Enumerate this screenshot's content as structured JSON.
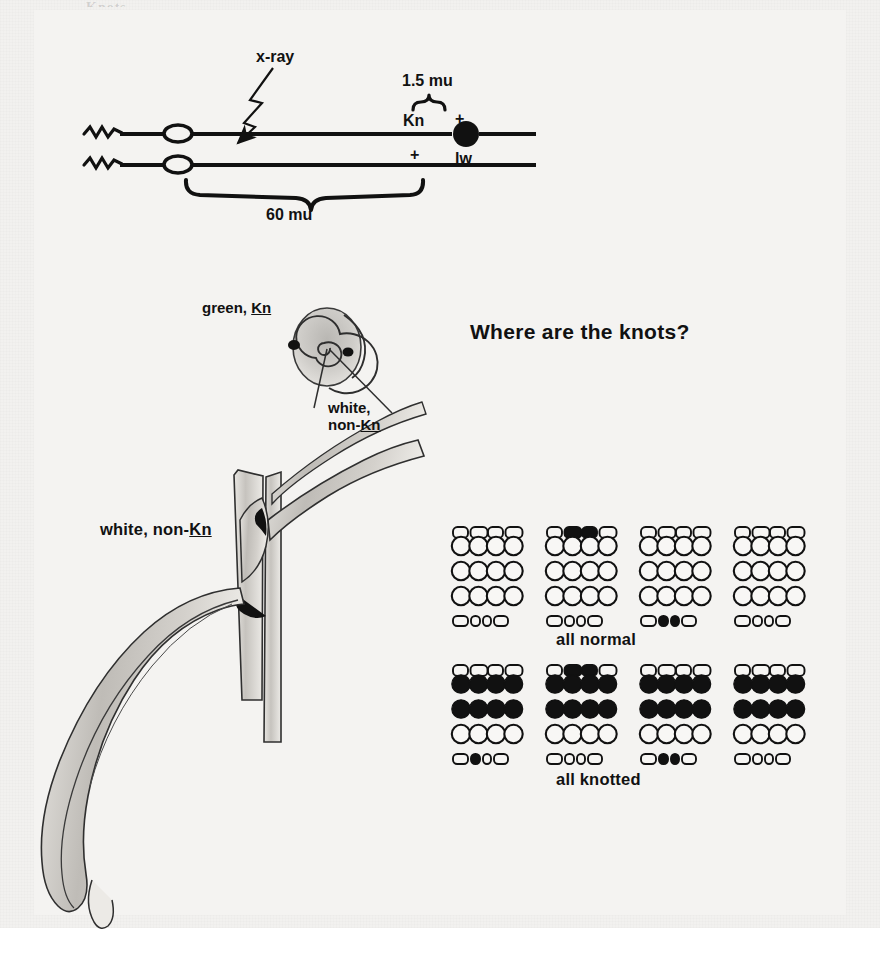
{
  "figure": {
    "title": "Where are the knots?",
    "cropped_header_text": "Knots",
    "background_color": "#f2f1ef",
    "ink_color": "#111111"
  },
  "chromosome_diagram": {
    "name": "chromosome-map",
    "xray_label": "x-ray",
    "distance_long": "60 mu",
    "distance_short": "1.5 mu",
    "top_strand_markers": [
      {
        "label": "Kn",
        "position": "left"
      },
      {
        "label": "+",
        "position": "right"
      }
    ],
    "bottom_strand_markers": [
      {
        "label": "+",
        "position": "left"
      },
      {
        "label": "lw",
        "position": "right"
      }
    ],
    "knob_symbol_top": "open-ellipse",
    "knob_symbol_bottom": "open-ellipse",
    "terminal_knob": "filled-circle"
  },
  "sector_diagram": {
    "name": "leaf-whorl-cross-section",
    "labels": {
      "green_kn": {
        "prefix": "green, ",
        "gene": "Kn"
      },
      "white_non_kn": {
        "line1": "white,",
        "prefix2": "non-",
        "gene": "Kn"
      }
    }
  },
  "plant_drawing": {
    "name": "maize-stem-leaf-drawing",
    "label": {
      "prefix": "white, non-",
      "gene": "Kn"
    }
  },
  "ear_panels": {
    "rows": [
      {
        "caption": "all normal",
        "ears": [
          {
            "name": "ear-1",
            "top_caps": [
              "white",
              "white",
              "white",
              "white"
            ],
            "grid": [
              [
                "white",
                "white",
                "white",
                "white"
              ],
              [
                "white",
                "white",
                "white",
                "white"
              ],
              [
                "white",
                "white",
                "white",
                "white"
              ]
            ],
            "bottom_caps": [
              "white",
              "white",
              "white",
              "white"
            ]
          },
          {
            "name": "ear-2",
            "top_caps": [
              "white",
              "black",
              "black",
              "white"
            ],
            "grid": [
              [
                "white",
                "white",
                "white",
                "white"
              ],
              [
                "white",
                "white",
                "white",
                "white"
              ],
              [
                "white",
                "white",
                "white",
                "white"
              ]
            ],
            "bottom_caps": [
              "white",
              "white",
              "white",
              "white"
            ]
          },
          {
            "name": "ear-3",
            "top_caps": [
              "white",
              "white",
              "white",
              "white"
            ],
            "grid": [
              [
                "white",
                "white",
                "white",
                "white"
              ],
              [
                "white",
                "white",
                "white",
                "white"
              ],
              [
                "white",
                "white",
                "white",
                "white"
              ]
            ],
            "bottom_caps": [
              "white",
              "black",
              "black",
              "white"
            ]
          },
          {
            "name": "ear-4",
            "top_caps": [
              "white",
              "white",
              "white",
              "white"
            ],
            "grid": [
              [
                "white",
                "white",
                "white",
                "white"
              ],
              [
                "white",
                "white",
                "white",
                "white"
              ],
              [
                "white",
                "white",
                "white",
                "white"
              ]
            ],
            "bottom_caps": [
              "white",
              "white",
              "white",
              "white"
            ]
          }
        ]
      },
      {
        "caption": "all knotted",
        "ears": [
          {
            "name": "ear-5",
            "top_caps": [
              "white",
              "white",
              "white",
              "white"
            ],
            "grid": [
              [
                "black",
                "black",
                "black",
                "black"
              ],
              [
                "black",
                "black",
                "black",
                "black"
              ],
              [
                "white",
                "white",
                "white",
                "white"
              ]
            ],
            "bottom_caps": [
              "white",
              "black",
              "white",
              "white"
            ]
          },
          {
            "name": "ear-6",
            "top_caps": [
              "white",
              "black",
              "black",
              "white"
            ],
            "grid": [
              [
                "black",
                "black",
                "black",
                "black"
              ],
              [
                "black",
                "black",
                "black",
                "black"
              ],
              [
                "white",
                "white",
                "white",
                "white"
              ]
            ],
            "bottom_caps": [
              "white",
              "white",
              "white",
              "white"
            ]
          },
          {
            "name": "ear-7",
            "top_caps": [
              "white",
              "white",
              "white",
              "white"
            ],
            "grid": [
              [
                "black",
                "black",
                "black",
                "black"
              ],
              [
                "black",
                "black",
                "black",
                "black"
              ],
              [
                "white",
                "white",
                "white",
                "white"
              ]
            ],
            "bottom_caps": [
              "white",
              "black",
              "black",
              "white"
            ]
          },
          {
            "name": "ear-8",
            "top_caps": [
              "white",
              "white",
              "white",
              "white"
            ],
            "grid": [
              [
                "black",
                "black",
                "black",
                "black"
              ],
              [
                "black",
                "black",
                "black",
                "black"
              ],
              [
                "white",
                "white",
                "white",
                "white"
              ]
            ],
            "bottom_caps": [
              "white",
              "white",
              "white",
              "white"
            ]
          }
        ]
      }
    ]
  }
}
